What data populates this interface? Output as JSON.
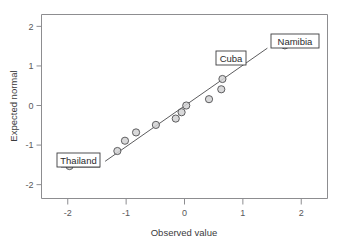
{
  "chart_data": {
    "type": "scatter",
    "title": "",
    "subtitle": "",
    "xlabel": "Observed value",
    "ylabel": "Expected normal",
    "xlim": [
      -2.45,
      2.45
    ],
    "ylim": [
      -2.35,
      2.3
    ],
    "xticks": [
      -2,
      -1,
      0,
      1,
      2
    ],
    "xtick_labels": [
      "-2",
      "-1",
      "0",
      "1",
      "2"
    ],
    "yticks": [
      2,
      1,
      0,
      -1,
      -2
    ],
    "ytick_labels": [
      "2",
      "1",
      "0",
      "-1",
      "-2"
    ],
    "grid": false,
    "legend": false,
    "points": [
      {
        "x": -1.97,
        "y": -1.53,
        "label": "Thailand"
      },
      {
        "x": -1.15,
        "y": -1.15,
        "label": ""
      },
      {
        "x": -1.02,
        "y": -0.89,
        "label": ""
      },
      {
        "x": -0.83,
        "y": -0.68,
        "label": ""
      },
      {
        "x": -0.49,
        "y": -0.49,
        "label": ""
      },
      {
        "x": -0.15,
        "y": -0.33,
        "label": ""
      },
      {
        "x": -0.05,
        "y": -0.17,
        "label": ""
      },
      {
        "x": 0.03,
        "y": 0.0,
        "label": ""
      },
      {
        "x": 0.42,
        "y": 0.16,
        "label": ""
      },
      {
        "x": 0.63,
        "y": 0.41,
        "label": ""
      },
      {
        "x": 0.65,
        "y": 0.67,
        "label": "Cuba"
      },
      {
        "x": 0.98,
        "y": 1.14,
        "label": ""
      },
      {
        "x": 1.72,
        "y": 1.52,
        "label": "Namibia"
      }
    ],
    "reference_line": {
      "x_start": -1.36,
      "y_start": -1.41,
      "x_end": 1.42,
      "y_end": 1.45
    },
    "annotations": [
      {
        "text": "Thailand",
        "target_x": -1.97,
        "target_y": -1.53
      },
      {
        "text": "Cuba",
        "target_x": 0.65,
        "target_y": 0.67
      },
      {
        "text": "Namibia",
        "target_x": 1.72,
        "target_y": 1.52
      }
    ],
    "colors": {
      "marker_fill": "#d2d2d4",
      "marker_stroke": "#4e4e50",
      "line": "#4a4a4c",
      "frame": "#8d8d90",
      "text": "#3b3b3d",
      "background": "#ffffff"
    }
  }
}
